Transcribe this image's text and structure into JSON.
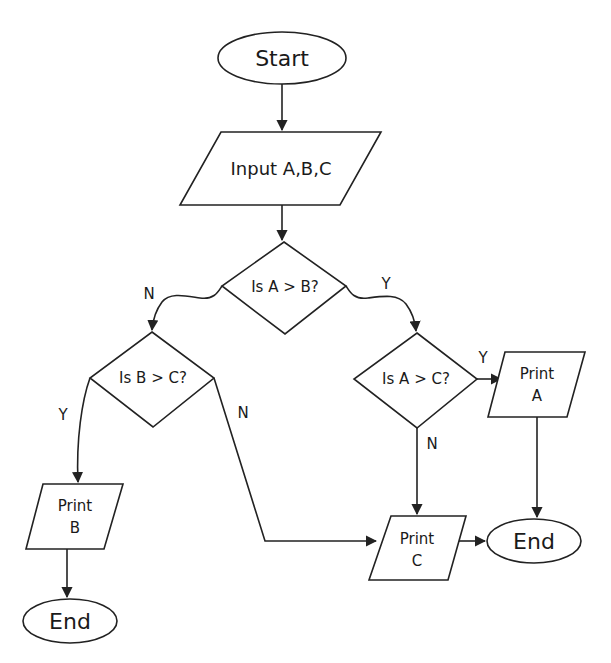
{
  "diagram": {
    "type": "flowchart",
    "colors": {
      "stroke": "#222222",
      "fill": "#ffffff",
      "text": "#1a1a1a",
      "background": "#ffffff"
    },
    "nodes": {
      "start": {
        "shape": "terminator",
        "label": "Start"
      },
      "input": {
        "shape": "parallelogram",
        "label": "Input A,B,C"
      },
      "decision_ab": {
        "shape": "diamond",
        "label": "Is A > B?"
      },
      "decision_bc": {
        "shape": "diamond",
        "label": "Is B > C?"
      },
      "decision_ac": {
        "shape": "diamond",
        "label": "Is A > C?"
      },
      "print_a": {
        "shape": "parallelogram",
        "line1": "Print",
        "line2": "A"
      },
      "print_b": {
        "shape": "parallelogram",
        "line1": "Print",
        "line2": "B"
      },
      "print_c": {
        "shape": "parallelogram",
        "line1": "Print",
        "line2": "C"
      },
      "end_left": {
        "shape": "terminator",
        "label": "End"
      },
      "end_right": {
        "shape": "terminator",
        "label": "End"
      }
    },
    "edges": [
      {
        "from": "start",
        "to": "input",
        "label": ""
      },
      {
        "from": "input",
        "to": "decision_ab",
        "label": ""
      },
      {
        "from": "decision_ab",
        "to": "decision_bc",
        "label": "N"
      },
      {
        "from": "decision_ab",
        "to": "decision_ac",
        "label": "Y"
      },
      {
        "from": "decision_bc",
        "to": "print_b",
        "label": "Y"
      },
      {
        "from": "decision_bc",
        "to": "print_c",
        "label": "N"
      },
      {
        "from": "decision_ac",
        "to": "print_a",
        "label": "Y"
      },
      {
        "from": "decision_ac",
        "to": "print_c",
        "label": "N"
      },
      {
        "from": "print_a",
        "to": "end_right",
        "label": ""
      },
      {
        "from": "print_c",
        "to": "end_right",
        "label": ""
      },
      {
        "from": "print_b",
        "to": "end_left",
        "label": ""
      }
    ],
    "edge_labels": {
      "ab_no": "N",
      "ab_yes": "Y",
      "bc_yes": "Y",
      "bc_no": "N",
      "ac_yes": "Y",
      "ac_no": "N"
    }
  }
}
